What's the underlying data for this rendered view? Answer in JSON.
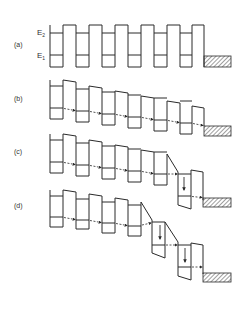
{
  "figure": {
    "type": "energy band diagram",
    "panels": [
      {
        "id": "a",
        "label": "(a)",
        "description": "Unbiased superlattice; aligned wells with levels E2 and E1",
        "level_labels": [
          "E2",
          "E1"
        ]
      },
      {
        "id": "b",
        "label": "(b)",
        "description": "Uniform field; sequential resonant tunneling E1 to E1 between adjacent wells"
      },
      {
        "id": "c",
        "label": "(c)",
        "description": "High-field domain forms at collector end; tunneling E1 to E2 with relaxation (down arrow)"
      },
      {
        "id": "d",
        "label": "(d)",
        "description": "High-field domain extends over two periods; two wells show E1 to E2 tunneling with relaxation"
      }
    ],
    "level_labels": {
      "e2": "E",
      "e2_sub": "2",
      "e1": "E",
      "e1_sub": "1"
    },
    "contact": "hatched collector contact at right of each panel"
  },
  "colors": {
    "line": "#2a2a2a",
    "background": "#ffffff"
  }
}
